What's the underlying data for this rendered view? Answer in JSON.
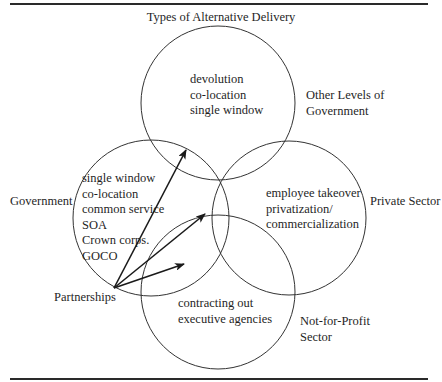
{
  "title": "Types of Alternative Delivery",
  "circles": {
    "top": {
      "label": [
        "Other Levels of",
        "Government"
      ],
      "items": [
        "devolution",
        "co-location",
        "single window"
      ]
    },
    "left": {
      "label": "Government",
      "items": [
        "single window",
        "co-location",
        "common service",
        "SOA",
        "Crown corps.",
        "GOCO"
      ]
    },
    "right": {
      "label": "Private Sector",
      "items": [
        "employee takeover",
        "privatization/",
        "commercialization"
      ]
    },
    "bottom": {
      "label": [
        "Not-for-Profit",
        "Sector"
      ],
      "items": [
        "contracting out",
        "executive agencies"
      ]
    }
  },
  "partnerships": {
    "label": "Partnerships",
    "arrow_targets": [
      "Other Levels of Government overlap",
      "Private Sector overlap",
      "Not-for-Profit Sector overlap"
    ]
  },
  "colors": {
    "line": "#2a2a2a",
    "text": "#1f1f1f",
    "background": "#ffffff"
  }
}
